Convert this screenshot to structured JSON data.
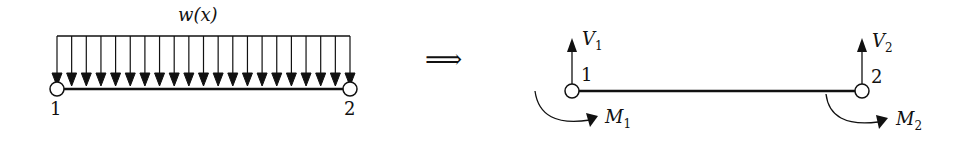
{
  "left_figure": {
    "load_label": "w(x)",
    "node1": "1",
    "node2": "2",
    "arrow_count": 21
  },
  "implies": "⟹",
  "right_figure": {
    "V1": "V",
    "V1_sub": "1",
    "V2": "V",
    "V2_sub": "2",
    "M1": "M",
    "M1_sub": "1",
    "M2": "M",
    "M2_sub": "2",
    "node1": "1",
    "node2": "2"
  }
}
